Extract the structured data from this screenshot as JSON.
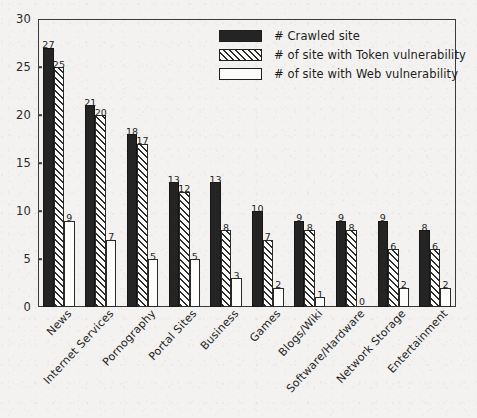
{
  "chart_data": {
    "type": "bar",
    "title": "",
    "subtitle": "",
    "xlabel": "",
    "ylabel": "",
    "ylim": [
      0,
      30
    ],
    "ytick_step": 5,
    "yticks": [
      "0",
      "5",
      "10",
      "15",
      "20",
      "25",
      "30"
    ],
    "grid": false,
    "legend_position": "top-center",
    "orientation": "vertical",
    "bar_value_labels": true,
    "categories": [
      "News",
      "Internet Services",
      "Pornography",
      "Portal Sites",
      "Business",
      "Games",
      "Blogs/Wiki",
      "Software/Hardware",
      "Network Storage",
      "Entertainment"
    ],
    "series": [
      {
        "name": "# Crawled site",
        "style": "solid-black",
        "color": "#242424",
        "values": [
          27,
          21,
          18,
          13,
          13,
          10,
          9,
          9,
          9,
          8
        ]
      },
      {
        "name": "# of site with Token vulnerability",
        "style": "diagonal-hatch",
        "color": "#fbfbfa",
        "values": [
          25,
          20,
          17,
          12,
          8,
          7,
          8,
          8,
          6,
          6
        ]
      },
      {
        "name": "# of site with Web vulnerability",
        "style": "empty-white",
        "color": "#fcfcfb",
        "values": [
          9,
          7,
          5,
          5,
          3,
          2,
          1,
          0,
          2,
          2
        ]
      }
    ]
  },
  "legend": {
    "items": [
      {
        "label": "# Crawled site",
        "style": "crawled"
      },
      {
        "label": "# of site with Token vulnerability",
        "style": "token"
      },
      {
        "label": "# of site with Web vulnerability",
        "style": "web"
      }
    ]
  },
  "colors": {
    "page_background": "#f3f2f0",
    "axis": "#3a3a3a",
    "text": "#1f1f1f",
    "series_crawled": "#242424",
    "series_token": "#fbfbfa",
    "series_web": "#fcfcfb"
  }
}
